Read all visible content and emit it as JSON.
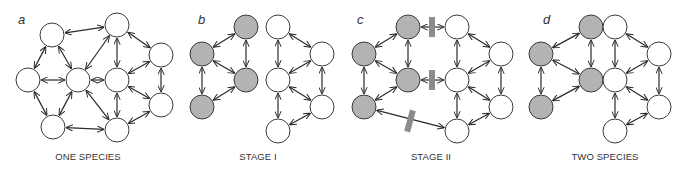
{
  "figure": {
    "node_radius": 12,
    "colors": {
      "node_white": "#ffffff",
      "node_gray": "#b3b3b3",
      "stroke": "#3a3a3a",
      "edge": "#2a2a2a",
      "barrier": "#8c8c8c",
      "text": "#333333"
    },
    "panels": [
      {
        "id": "a",
        "letter": "a",
        "letter_pos": [
          18,
          24
        ],
        "caption": "ONE SPECIES",
        "caption_x": 88,
        "nodes": [
          {
            "id": "n1",
            "x": 52,
            "y": 35,
            "fill": "white"
          },
          {
            "id": "n2",
            "x": 117,
            "y": 25,
            "fill": "white"
          },
          {
            "id": "n3",
            "x": 161,
            "y": 55,
            "fill": "white"
          },
          {
            "id": "n4",
            "x": 28,
            "y": 80,
            "fill": "white"
          },
          {
            "id": "n5",
            "x": 78,
            "y": 80,
            "fill": "white"
          },
          {
            "id": "n6",
            "x": 117,
            "y": 80,
            "fill": "white"
          },
          {
            "id": "n7",
            "x": 161,
            "y": 105,
            "fill": "white"
          },
          {
            "id": "n8",
            "x": 53,
            "y": 127,
            "fill": "white"
          },
          {
            "id": "n9",
            "x": 117,
            "y": 130,
            "fill": "white"
          }
        ],
        "edges": [
          [
            "n1",
            "n2"
          ],
          [
            "n1",
            "n4"
          ],
          [
            "n1",
            "n5"
          ],
          [
            "n2",
            "n5"
          ],
          [
            "n2",
            "n6"
          ],
          [
            "n2",
            "n3"
          ],
          [
            "n4",
            "n5"
          ],
          [
            "n4",
            "n8"
          ],
          [
            "n5",
            "n8"
          ],
          [
            "n5",
            "n6"
          ],
          [
            "n5",
            "n9"
          ],
          [
            "n3",
            "n6"
          ],
          [
            "n3",
            "n7"
          ],
          [
            "n6",
            "n9"
          ],
          [
            "n6",
            "n7"
          ],
          [
            "n7",
            "n9"
          ],
          [
            "n8",
            "n9"
          ]
        ],
        "barriers": []
      },
      {
        "id": "b",
        "letter": "b",
        "letter_pos": [
          198,
          24
        ],
        "caption": "STAGE I",
        "caption_x": 258,
        "nodes": [
          {
            "id": "g1",
            "x": 246,
            "y": 27,
            "fill": "gray"
          },
          {
            "id": "g2",
            "x": 202,
            "y": 54,
            "fill": "gray"
          },
          {
            "id": "g3",
            "x": 246,
            "y": 80,
            "fill": "gray"
          },
          {
            "id": "g4",
            "x": 202,
            "y": 107,
            "fill": "gray"
          },
          {
            "id": "w1",
            "x": 278,
            "y": 27,
            "fill": "white"
          },
          {
            "id": "w2",
            "x": 322,
            "y": 54,
            "fill": "white"
          },
          {
            "id": "w3",
            "x": 278,
            "y": 80,
            "fill": "white"
          },
          {
            "id": "w4",
            "x": 322,
            "y": 107,
            "fill": "white"
          },
          {
            "id": "w5",
            "x": 278,
            "y": 131,
            "fill": "white"
          }
        ],
        "edges": [
          [
            "g1",
            "g2"
          ],
          [
            "g1",
            "g3"
          ],
          [
            "g2",
            "g3"
          ],
          [
            "g2",
            "g4"
          ],
          [
            "g3",
            "g4"
          ],
          [
            "w1",
            "w2"
          ],
          [
            "w1",
            "w3"
          ],
          [
            "w2",
            "w3"
          ],
          [
            "w2",
            "w4"
          ],
          [
            "w3",
            "w4"
          ],
          [
            "w3",
            "w5"
          ],
          [
            "w4",
            "w5"
          ]
        ],
        "barriers": []
      },
      {
        "id": "c",
        "letter": "c",
        "letter_pos": [
          357,
          24
        ],
        "caption": "STAGE II",
        "caption_x": 431,
        "nodes": [
          {
            "id": "g1",
            "x": 408,
            "y": 27,
            "fill": "gray"
          },
          {
            "id": "g2",
            "x": 364,
            "y": 54,
            "fill": "gray"
          },
          {
            "id": "g3",
            "x": 408,
            "y": 80,
            "fill": "gray"
          },
          {
            "id": "g4",
            "x": 364,
            "y": 107,
            "fill": "gray"
          },
          {
            "id": "w1",
            "x": 457,
            "y": 27,
            "fill": "white"
          },
          {
            "id": "w2",
            "x": 501,
            "y": 54,
            "fill": "white"
          },
          {
            "id": "w3",
            "x": 457,
            "y": 80,
            "fill": "white"
          },
          {
            "id": "w4",
            "x": 501,
            "y": 107,
            "fill": "white"
          },
          {
            "id": "w5",
            "x": 457,
            "y": 131,
            "fill": "white"
          }
        ],
        "edges": [
          [
            "g1",
            "g2"
          ],
          [
            "g1",
            "g3"
          ],
          [
            "g2",
            "g3"
          ],
          [
            "g2",
            "g4"
          ],
          [
            "g3",
            "g4"
          ],
          [
            "g1",
            "w1"
          ],
          [
            "g3",
            "w3"
          ],
          [
            "g4",
            "w5"
          ],
          [
            "w1",
            "w2"
          ],
          [
            "w1",
            "w3"
          ],
          [
            "w2",
            "w3"
          ],
          [
            "w2",
            "w4"
          ],
          [
            "w3",
            "w4"
          ],
          [
            "w3",
            "w5"
          ],
          [
            "w4",
            "w5"
          ]
        ],
        "barriers": [
          {
            "x": 432,
            "y": 27,
            "w": 6,
            "h": 20,
            "angle": 0
          },
          {
            "x": 432,
            "y": 80,
            "w": 6,
            "h": 20,
            "angle": 0
          },
          {
            "x": 410,
            "y": 121,
            "w": 6,
            "h": 22,
            "angle": 15
          }
        ]
      },
      {
        "id": "d",
        "letter": "d",
        "letter_pos": [
          543,
          24
        ],
        "caption": "TWO SPECIES",
        "caption_x": 605,
        "nodes": [
          {
            "id": "g1",
            "x": 591,
            "y": 27,
            "fill": "gray"
          },
          {
            "id": "g2",
            "x": 541,
            "y": 54,
            "fill": "gray"
          },
          {
            "id": "g3",
            "x": 591,
            "y": 80,
            "fill": "gray"
          },
          {
            "id": "g4",
            "x": 541,
            "y": 107,
            "fill": "gray"
          },
          {
            "id": "w1",
            "x": 615,
            "y": 27,
            "fill": "white"
          },
          {
            "id": "w2",
            "x": 659,
            "y": 54,
            "fill": "white"
          },
          {
            "id": "w3",
            "x": 615,
            "y": 80,
            "fill": "white"
          },
          {
            "id": "w4",
            "x": 659,
            "y": 107,
            "fill": "white"
          },
          {
            "id": "w5",
            "x": 615,
            "y": 131,
            "fill": "white"
          }
        ],
        "edges": [
          [
            "g1",
            "g2"
          ],
          [
            "g1",
            "g3"
          ],
          [
            "g2",
            "g3"
          ],
          [
            "g2",
            "g4"
          ],
          [
            "g3",
            "g4"
          ],
          [
            "w1",
            "w2"
          ],
          [
            "w1",
            "w3"
          ],
          [
            "w2",
            "w3"
          ],
          [
            "w2",
            "w4"
          ],
          [
            "w3",
            "w4"
          ],
          [
            "w3",
            "w5"
          ],
          [
            "w4",
            "w5"
          ]
        ],
        "barriers": []
      }
    ],
    "caption_y": 160
  }
}
